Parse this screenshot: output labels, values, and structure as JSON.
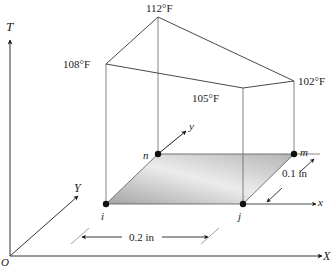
{
  "figure": {
    "axes": {
      "T": "T",
      "X": "X",
      "Y": "Y",
      "origin": "O",
      "local_x": "x",
      "local_y": "y"
    },
    "nodes": {
      "i": "i",
      "j": "j",
      "m": "m",
      "n": "n"
    },
    "temperatures": {
      "i": "108°F",
      "n": "112°F",
      "m": "102°F",
      "j": "105°F"
    },
    "dimensions": {
      "width": "0.2 in",
      "depth": "0.1 in"
    },
    "colors": {
      "line": "#333333",
      "element_fill_dark": "#a9a9a9",
      "element_fill_light": "#ececec",
      "node": "#111111"
    }
  }
}
